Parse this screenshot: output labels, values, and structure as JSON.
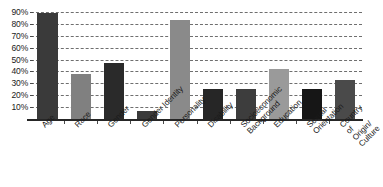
{
  "chart_data": {
    "type": "bar",
    "title": "",
    "xlabel": "",
    "ylabel": "",
    "ylim": [
      0,
      95
    ],
    "grid": true,
    "legend": false,
    "categories": [
      "Age",
      "Race",
      "Gender",
      "Gender Identity",
      "Personality",
      "Disability",
      "Socioeconomic\nBackground",
      "Education",
      "Sexual Orientation",
      "Country of Origin/\nCulture"
    ],
    "values": [
      89,
      38,
      47,
      7,
      83,
      25,
      25,
      42,
      25,
      33
    ],
    "bar_colors": [
      "#3a3a3a",
      "#808080",
      "#2a2a2a",
      "#3a3a3a",
      "#8a8a8a",
      "#262626",
      "#3d3d3d",
      "#9a9a9a",
      "#161616",
      "#4a4a4a"
    ],
    "y_ticks": [
      {
        "label": "90%",
        "value": 90
      },
      {
        "label": "80%",
        "value": 80
      },
      {
        "label": "70%",
        "value": 70
      },
      {
        "label": "60%",
        "value": 60
      },
      {
        "label": "50%",
        "value": 50
      },
      {
        "label": "40%",
        "value": 40
      },
      {
        "label": "30%",
        "value": 30
      },
      {
        "label": "20%",
        "value": 20
      },
      {
        "label": "10%",
        "value": 10
      }
    ],
    "axis_color": "#262626",
    "gridline_color": "#6f6f6f",
    "background": "#ffffff"
  }
}
